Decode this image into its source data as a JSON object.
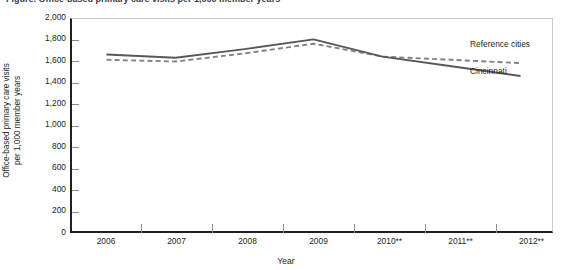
{
  "figure": {
    "caption_sliver": "Figure. Office-based primary care visits per 1,000 member years",
    "xlabel": "Year",
    "ylabel_line1": "Office-based primary care visits",
    "ylabel_line2": "per 1,000 member years",
    "colors": {
      "cincinnati": "#58595b",
      "reference": "#808285",
      "axis": "#231f20",
      "frame": "#c9c9c9",
      "tick": "#8d8d8d"
    }
  },
  "legend": {
    "reference_label": "Reference cities",
    "cincinnati_label": "Cincinnati"
  },
  "yticks": [
    "2,000",
    "1,800",
    "1,600",
    "1,400",
    "1,200",
    "1,000",
    "800",
    "600",
    "400",
    "200",
    "0"
  ],
  "chart_data": {
    "type": "line",
    "title": "Office-based primary care visits per 1,000 member years",
    "xlabel": "Year",
    "ylabel": "Office-based primary care visits per 1,000 member years",
    "categories": [
      "2006",
      "2007",
      "2008",
      "2009",
      "2010**",
      "2011**",
      "2012**"
    ],
    "ylim": [
      0,
      2000
    ],
    "ytick_step": 200,
    "grid": false,
    "legend_position": "inline-right",
    "series": [
      {
        "name": "Cincinnati",
        "style": "solid",
        "color": "#58595b",
        "values": [
          1670,
          1640,
          1720,
          1810,
          1650,
          1560,
          1470
        ]
      },
      {
        "name": "Reference cities",
        "style": "dashed",
        "color": "#808285",
        "values": [
          1620,
          1605,
          1680,
          1770,
          1650,
          1620,
          1590
        ]
      }
    ]
  }
}
